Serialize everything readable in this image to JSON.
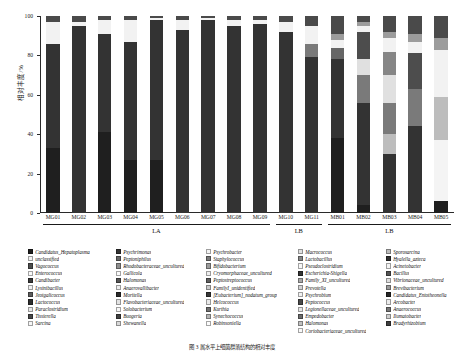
{
  "figure": {
    "caption": "图 3 属水平上细菌群落结构的相对丰度",
    "ylabel": "相对丰度/%"
  },
  "axes": {
    "y_ticks": [
      "0",
      "20",
      "40",
      "60",
      "80",
      "100"
    ],
    "y_min": 0,
    "y_max": 100
  },
  "groups": [
    {
      "label": "LA",
      "start": 0,
      "end": 8
    },
    {
      "label": "LB",
      "start": 9,
      "end": 10
    },
    {
      "label": "LB",
      "start": 11,
      "end": 15
    }
  ],
  "legend": {
    "columns": [
      {
        "items": [
          {
            "label": "Candidatus_Hepatoplasma",
            "color": "#1f1f1f"
          },
          {
            "label": "unclassified",
            "color": "#f2f2f2"
          },
          {
            "label": "Vagococcus",
            "color": "#4d4d4d"
          },
          {
            "label": "Enterococcus",
            "color": "#fafafa"
          },
          {
            "label": "Candibacter",
            "color": "#3a3a3a"
          },
          {
            "label": "Lysinibacillus",
            "color": "#f0f0f0"
          },
          {
            "label": "Jeotgalicoccus",
            "color": "#5c5c5c"
          },
          {
            "label": "Lactococcus",
            "color": "#2e2e2e"
          },
          {
            "label": "Paraclostridium",
            "color": "#e8e8e8"
          },
          {
            "label": "Tissierella",
            "color": "#474747"
          },
          {
            "label": "Sarcina",
            "color": "#f6f6f6"
          }
        ]
      },
      {
        "items": [
          {
            "label": "Psychrimonas",
            "color": "#333333"
          },
          {
            "label": "Peptoniphilus",
            "color": "#666666"
          },
          {
            "label": "Rhodobacteraceae_uncultured",
            "color": "#8f8f8f"
          },
          {
            "label": "Gallicola",
            "color": "#fbfbfb"
          },
          {
            "label": "Halomonas",
            "color": "#555555"
          },
          {
            "label": "Anaerovallibacter",
            "color": "#ededed"
          },
          {
            "label": "Moritella",
            "color": "#2b2b2b"
          },
          {
            "label": "Flavobacteriaceae_uncultured",
            "color": "#e3e3e3"
          },
          {
            "label": "Solobacterium",
            "color": "#f8f8f8"
          },
          {
            "label": "Buogeria",
            "color": "#414141"
          },
          {
            "label": "Shewanella",
            "color": "#d9d9d9"
          }
        ]
      },
      {
        "items": [
          {
            "label": "Psychrobacter",
            "color": "#f4f4f4"
          },
          {
            "label": "Staphylococcus",
            "color": "#7a7a7a"
          },
          {
            "label": "Bifidobacterium",
            "color": "#9c9c9c"
          },
          {
            "label": "Cryomorphaceae_uncultured",
            "color": "#efefef"
          },
          {
            "label": "Peptostreptococcus",
            "color": "#5f5f5f"
          },
          {
            "label": "FamilyI_unidentified",
            "color": "#c9c9c9"
          },
          {
            "label": "[Eubacterium]_nodatum_group",
            "color": "#383838"
          },
          {
            "label": "Helcococcus",
            "color": "#eaeaea"
          },
          {
            "label": "Kurthia",
            "color": "#707070"
          },
          {
            "label": "Synechococcus",
            "color": "#b5b5b5"
          },
          {
            "label": "Robinsoniella",
            "color": "#fcfcfc"
          }
        ]
      },
      {
        "items": [
          {
            "label": "Macrococcus",
            "color": "#e0e0e0"
          },
          {
            "label": "Lactobacillus",
            "color": "#868686"
          },
          {
            "label": "Pseudoclostridium",
            "color": "#f7f7f7"
          },
          {
            "label": "Escherichia-Shigella",
            "color": "#343434"
          },
          {
            "label": "Family_XI_uncultured",
            "color": "#a8a8a8"
          },
          {
            "label": "Prevotella",
            "color": "#d2d2d2"
          },
          {
            "label": "Psychrobium",
            "color": "#f1f1f1"
          },
          {
            "label": "Peptococcus",
            "color": "#4a4a4a"
          },
          {
            "label": "Legionellaceae_uncultured",
            "color": "#e6e6e6"
          },
          {
            "label": "Empedobacter",
            "color": "#6b6b6b"
          },
          {
            "label": "Halomonas",
            "color": "#c0c0c0"
          },
          {
            "label": "Coriobacteriaceae_uncultured",
            "color": "#f9f9f9"
          }
        ]
      },
      {
        "items": [
          {
            "label": "Sporosarcina",
            "color": "#bdbdbd"
          },
          {
            "label": "Hyalella_azteca",
            "color": "#2f2f2f"
          },
          {
            "label": "Acinetobacter",
            "color": "#f3f3f3"
          },
          {
            "label": "Bacillus",
            "color": "#545454"
          },
          {
            "label": "Vibrionaceae_uncultured",
            "color": "#dedede"
          },
          {
            "label": "Brevibacterium",
            "color": "#9a9a9a"
          },
          {
            "label": "Candidatus_Entotheonella",
            "color": "#262626"
          },
          {
            "label": "Arcobacter",
            "color": "#ececec"
          },
          {
            "label": "Anaerococcus",
            "color": "#777777"
          },
          {
            "label": "Ilumatobacter",
            "color": "#cfcfcf"
          },
          {
            "label": "Bradyrhizobium",
            "color": "#3d3d3d"
          }
        ]
      }
    ]
  },
  "chart_data": {
    "type": "bar",
    "stacked": true,
    "title": "",
    "xlabel": "",
    "ylabel": "相对丰度/%",
    "ylim": [
      0,
      100
    ],
    "grid": false,
    "legend_position": "bottom",
    "categories": [
      "MG01",
      "MG02",
      "MG03",
      "MG04",
      "MG05",
      "MG06",
      "MG07",
      "MG08",
      "MG09",
      "MG10",
      "MG11",
      "MB01",
      "MB02",
      "MB03",
      "MB04",
      "MB05"
    ],
    "series": [
      {
        "name": "Candidatus_Hepatoplasma",
        "color": "#1f1f1f",
        "values": [
          33,
          0,
          41,
          27,
          27,
          0,
          0,
          0,
          0,
          0,
          0,
          38,
          4,
          0,
          0,
          6
        ]
      },
      {
        "name": "Psychrimonas",
        "color": "#333333",
        "values": [
          53,
          95,
          50,
          60,
          71,
          93,
          98,
          95,
          96,
          92,
          79,
          40,
          52,
          30,
          44,
          0
        ]
      },
      {
        "name": "Psychrobacter",
        "color": "#f4f4f4",
        "values": [
          0,
          0,
          0,
          0,
          0,
          0,
          0,
          0,
          0,
          0,
          0,
          0,
          0,
          0,
          0,
          31
        ]
      },
      {
        "name": "Sporosarcina",
        "color": "#bdbdbd",
        "values": [
          0,
          0,
          0,
          0,
          0,
          0,
          0,
          0,
          0,
          0,
          0,
          0,
          0,
          10,
          0,
          22
        ]
      },
      {
        "name": "Staphylococcus",
        "color": "#7a7a7a",
        "values": [
          0,
          0,
          0,
          0,
          0,
          0,
          0,
          0,
          0,
          0,
          7,
          0,
          14,
          16,
          19,
          0
        ]
      },
      {
        "name": "Macrococcus",
        "color": "#e0e0e0",
        "values": [
          0,
          0,
          0,
          0,
          0,
          0,
          0,
          0,
          0,
          0,
          0,
          0,
          8,
          14,
          0,
          0
        ]
      },
      {
        "name": "Lactobacillus",
        "color": "#868686",
        "values": [
          0,
          0,
          0,
          0,
          0,
          0,
          0,
          0,
          0,
          0,
          0,
          0,
          0,
          12,
          0,
          0
        ]
      },
      {
        "name": "Vagococcus",
        "color": "#4d4d4d",
        "values": [
          0,
          0,
          0,
          0,
          0,
          0,
          0,
          0,
          0,
          0,
          0,
          0,
          14,
          0,
          18,
          0
        ]
      },
      {
        "name": "Peptoniphilus",
        "color": "#666666",
        "values": [
          0,
          0,
          0,
          0,
          0,
          0,
          0,
          0,
          0,
          0,
          0,
          6,
          0,
          0,
          0,
          0
        ]
      },
      {
        "name": "unclassified",
        "color": "#f2f2f2",
        "values": [
          11,
          2,
          7,
          11,
          1,
          5,
          1,
          3,
          2,
          5,
          9,
          4,
          3,
          7,
          6,
          24
        ]
      },
      {
        "name": "Bifidobacterium",
        "color": "#9c9c9c",
        "values": [
          0,
          0,
          0,
          0,
          0,
          0,
          0,
          0,
          0,
          0,
          0,
          3,
          2,
          3,
          4,
          6
        ]
      },
      {
        "name": "others",
        "color": "#4a4a4a",
        "values": [
          3,
          3,
          2,
          2,
          1,
          2,
          1,
          2,
          2,
          3,
          5,
          9,
          3,
          8,
          9,
          11
        ]
      }
    ]
  }
}
